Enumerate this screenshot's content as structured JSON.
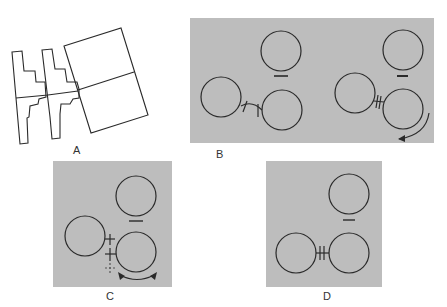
{
  "figure": {
    "panels": [
      {
        "id": "A",
        "label": "A",
        "type": "line-drawing",
        "description": "two staircase-shaped outlines adjoining a tilted rectangle split in two"
      },
      {
        "id": "B",
        "label": "B",
        "type": "gray-panel",
        "description": "two groups of three circles; left group joined by a bent link, right group with rotation arrow"
      },
      {
        "id": "C",
        "label": "C",
        "type": "gray-panel",
        "description": "three circles with cross marks and a double-headed arc arrow"
      },
      {
        "id": "D",
        "label": "D",
        "type": "gray-panel",
        "description": "three circles; bottom pair joined by a short H-link"
      }
    ],
    "colors": {
      "panel_bg": "#bdbdbd",
      "stroke": "#2a2a2a",
      "page_bg": "#ffffff"
    }
  }
}
